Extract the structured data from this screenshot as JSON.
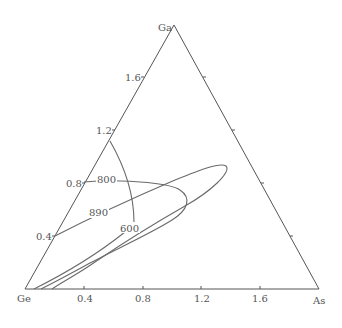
{
  "diagram": {
    "type": "ternary",
    "vertices": {
      "bottom_left": "Ge",
      "bottom_right": "As",
      "top": "Ga"
    },
    "bottom_axis_ticks": [
      "0.4",
      "0.8",
      "1.2",
      "1.6"
    ],
    "left_axis_ticks": [
      "0.4",
      "0.8",
      "1.2",
      "1.6"
    ],
    "right_axis_ticks": [
      "",
      "",
      "",
      ""
    ],
    "contour_labels": [
      "800",
      "890",
      "600"
    ],
    "line_color": "#6a6a6a",
    "text_color": "#555555"
  }
}
